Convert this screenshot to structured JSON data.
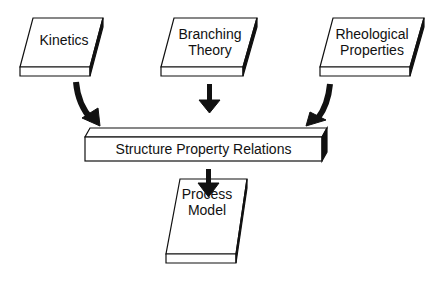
{
  "diagram": {
    "inputs": [
      {
        "label_line1": "Kinetics",
        "label_line2": ""
      },
      {
        "label_line1": "Branching",
        "label_line2": "Theory"
      },
      {
        "label_line1": "Rheological",
        "label_line2": "Properties"
      }
    ],
    "center": {
      "label": "Structure Property Relations"
    },
    "output": {
      "label_line1": "Process",
      "label_line2": "Model"
    },
    "colors": {
      "stroke": "#111111",
      "fill": "#ffffff"
    }
  }
}
